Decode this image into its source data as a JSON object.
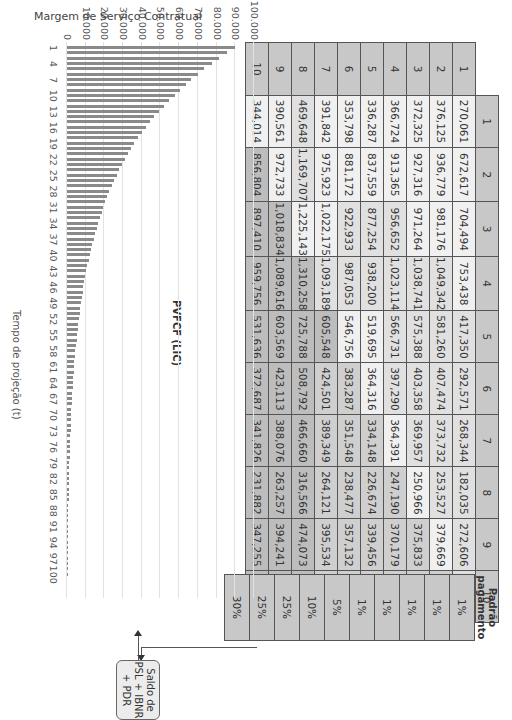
{
  "table": {
    "column_headers": [
      "1",
      "2",
      "3",
      "4",
      "5",
      "6",
      "7",
      "8",
      "9",
      "10"
    ],
    "row_headers": [
      "1",
      "2",
      "3",
      "4",
      "5",
      "6",
      "7",
      "8",
      "9",
      "10"
    ],
    "rows": [
      [
        "270,061",
        "672,617",
        "704,494",
        "753,438",
        "417,350",
        "292,571",
        "268,344",
        "182,035",
        "272,606",
        "67,948"
      ],
      [
        "376,125",
        "936,779",
        "981,176",
        "1,049,342",
        "581,260",
        "407,474",
        "373,732",
        "253,527",
        "379,669",
        "94,634"
      ],
      [
        "372,325",
        "927,316",
        "971,264",
        "1,038,741",
        "575,388",
        "403,358",
        "369,957",
        "250,966",
        "375,833",
        "93,678"
      ],
      [
        "366,724",
        "913,365",
        "956,652",
        "1,023,114",
        "566,731",
        "397,290",
        "364,391",
        "247,190",
        "370,179",
        "92,268"
      ],
      [
        "336,287",
        "837,559",
        "877,254",
        "938,200",
        "519,695",
        "364,316",
        "334,148",
        "226,674",
        "339,456",
        "84,611"
      ],
      [
        "353,798",
        "881,172",
        "922,933",
        "987,053",
        "546,756",
        "383,287",
        "351,548",
        "238,477",
        "357,132",
        "89,016"
      ],
      [
        "391,842",
        "975,923",
        "1,022,175",
        "1,093,189",
        "605,548",
        "424,501",
        "389,349",
        "264,121",
        "395,534",
        "98,588"
      ],
      [
        "469,648",
        "1,169,707",
        "1,225,143",
        "1,310,258",
        "725,788",
        "508,792",
        "466,660",
        "316,566",
        "474,073",
        "118,164"
      ],
      [
        "390,561",
        "972,733",
        "1,018,834",
        "1,089,616",
        "603,569",
        "423,113",
        "388,076",
        "263,257",
        "394,241",
        "98,266"
      ],
      [
        "344,014",
        "856,804",
        "897,410",
        "959,756",
        "531,636",
        "372,687",
        "341,826",
        "231,882",
        "347,255",
        "86,555"
      ]
    ]
  },
  "payment_pattern": {
    "title_line1": "Padrão",
    "title_line2": "pagamento",
    "values": [
      "1%",
      "1%",
      "1%",
      "1%",
      "1%",
      "5%",
      "10%",
      "25%",
      "25%",
      "30%"
    ]
  },
  "saldo_box": {
    "line1": "Saldo de",
    "line2": "PSL + IBNR",
    "line3": "+ PDR"
  },
  "chart_data": {
    "type": "bar",
    "title": "Margem de Serviço Contratual",
    "xlabel": "Tempo de projeção (t)",
    "ylabel": "",
    "series_label": "PVFCF (LIC)",
    "ylim": [
      0,
      100000
    ],
    "y_ticks": [
      "0",
      "10.000",
      "20.000",
      "30.000",
      "40.000",
      "50.000",
      "60.000",
      "70.000",
      "80.000",
      "90.000",
      "100.000"
    ],
    "x_ticks": [
      "1",
      "4",
      "7",
      "10",
      "13",
      "16",
      "19",
      "22",
      "25",
      "28",
      "31",
      "34",
      "37",
      "40",
      "43",
      "46",
      "49",
      "52",
      "55",
      "58",
      "61",
      "64",
      "67",
      "70",
      "73",
      "76",
      "79",
      "82",
      "85",
      "88",
      "91",
      "94",
      "97",
      "100"
    ],
    "grid": true,
    "x": [
      1,
      2,
      3,
      4,
      5,
      6,
      7,
      8,
      9,
      10,
      11,
      12,
      13,
      14,
      15,
      16,
      17,
      18,
      19,
      20,
      21,
      22,
      23,
      24,
      25,
      26,
      27,
      28,
      29,
      30,
      31,
      32,
      33,
      34,
      35,
      36,
      37,
      38,
      39,
      40,
      41,
      42,
      43,
      44,
      45,
      46,
      47,
      48,
      49,
      50,
      51,
      52,
      53,
      54,
      55,
      56,
      57,
      58,
      59,
      60,
      61,
      62,
      63,
      64,
      65,
      66,
      67,
      68,
      69,
      70,
      71,
      72,
      73,
      74,
      75,
      76,
      77,
      78,
      79,
      80,
      81,
      82,
      83,
      84,
      85,
      86,
      87,
      88,
      89,
      90,
      91,
      92,
      93,
      94,
      95,
      96,
      97,
      98,
      99,
      100
    ],
    "values": [
      90000,
      85500,
      81500,
      77500,
      73500,
      70000,
      66500,
      63500,
      60500,
      57500,
      54500,
      52000,
      49000,
      46500,
      44500,
      42000,
      40000,
      38000,
      36000,
      34000,
      32500,
      31000,
      29500,
      28000,
      26500,
      25000,
      23800,
      22700,
      21600,
      20500,
      19500,
      18500,
      17600,
      16700,
      15800,
      15000,
      14200,
      13500,
      12800,
      12100,
      11500,
      10900,
      10300,
      9800,
      9300,
      8800,
      8300,
      7900,
      7500,
      7100,
      6700,
      6300,
      6000,
      5700,
      5400,
      5100,
      4800,
      4500,
      4300,
      4000,
      3800,
      3600,
      3400,
      3200,
      3000,
      2850,
      2700,
      2550,
      2400,
      2250,
      2100,
      2000,
      1900,
      1800,
      1700,
      1600,
      1500,
      1400,
      1300,
      1250,
      1150,
      1100,
      1000,
      950,
      900,
      850,
      800,
      750,
      700,
      650,
      600,
      550,
      500,
      480,
      450,
      420,
      400,
      380,
      350,
      330
    ]
  }
}
